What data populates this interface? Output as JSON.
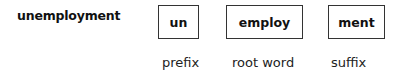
{
  "word": "unemployment",
  "parts": [
    {
      "text": "un",
      "role": "prefix"
    },
    {
      "text": "employ",
      "role": "root word"
    },
    {
      "text": "ment",
      "role": "suffix"
    }
  ],
  "colors": {
    "text": "#111111",
    "border": "#333333",
    "background": "#ffffff"
  }
}
